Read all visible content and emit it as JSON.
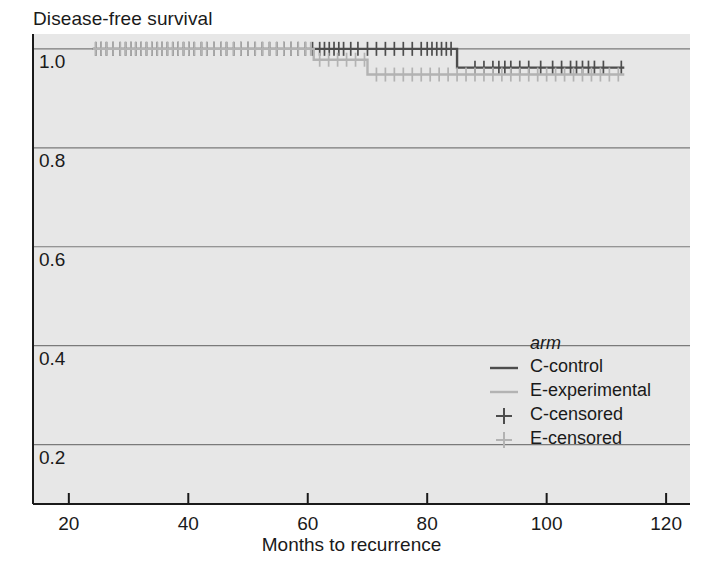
{
  "chart_data": {
    "type": "line",
    "subtype": "kaplan-meier-step",
    "title": "Disease-free survival",
    "xlabel": "Months to recurrence",
    "ylabel": "",
    "xlim": [
      14,
      124
    ],
    "ylim": [
      0.08,
      1.03
    ],
    "xticks": [
      20,
      40,
      60,
      80,
      100,
      120
    ],
    "yticks": [
      1.0,
      0.8,
      0.6,
      0.4,
      0.2
    ],
    "xtick_labels": [
      "20",
      "40",
      "60",
      "80",
      "100",
      "120"
    ],
    "ytick_labels": [
      "1.0",
      "0.8",
      "0.6",
      "0.4",
      "0.2"
    ],
    "grid": "horizontal",
    "legend_position": "inside-right",
    "legend_title": "arm",
    "plot_bgcolor": "#e7e7e7",
    "colors": {
      "control": "#4d4d4d",
      "experimental": "#b3b3b3",
      "grid": "#7a7a7a",
      "axis": "#1a1a1a",
      "background": "#ffffff"
    },
    "series": [
      {
        "name": "C-control",
        "label": "C-control",
        "color": "#4d4d4d",
        "steps": [
          {
            "x": 24.0,
            "y": 1.0
          },
          {
            "x": 85.0,
            "y": 1.0
          },
          {
            "x": 85.0,
            "y": 0.962
          },
          {
            "x": 113.0,
            "y": 0.962
          }
        ],
        "censored_times": [
          24.5,
          25.4,
          26.3,
          27.4,
          28.6,
          29.5,
          30.4,
          31.2,
          32.1,
          33.0,
          33.9,
          34.8,
          35.6,
          36.5,
          37.4,
          38.3,
          39.2,
          40.1,
          41.0,
          42.2,
          43.1,
          44.3,
          45.5,
          46.4,
          47.6,
          48.8,
          50.0,
          51.2,
          52.4,
          53.6,
          54.8,
          56.0,
          57.2,
          58.4,
          59.6,
          60.8,
          62.0,
          62.8,
          63.6,
          64.4,
          65.2,
          66.0,
          67.2,
          68.4,
          70.0,
          71.5,
          73.0,
          74.5,
          76.0,
          77.5,
          79.0,
          80.0,
          80.8,
          81.6,
          82.4,
          83.2,
          84.0,
          88.0,
          89.5,
          91.0,
          92.0,
          93.0,
          94.0,
          95.5,
          97.0,
          99.0,
          101.0,
          102.5,
          104.0,
          105.0,
          106.0,
          107.0,
          108.0,
          109.5,
          112.5
        ],
        "censored_y": [
          1.0,
          0.962
        ],
        "censored_split_time": 85.0
      },
      {
        "name": "E-experimental",
        "label": "E-experimental",
        "color": "#b3b3b3",
        "steps": [
          {
            "x": 24.0,
            "y": 1.0
          },
          {
            "x": 61.0,
            "y": 1.0
          },
          {
            "x": 61.0,
            "y": 0.978
          },
          {
            "x": 70.0,
            "y": 0.978
          },
          {
            "x": 70.0,
            "y": 0.948
          },
          {
            "x": 113.0,
            "y": 0.948
          }
        ],
        "censored_times": [
          24.5,
          25.4,
          26.3,
          27.4,
          28.6,
          29.5,
          30.4,
          31.2,
          32.1,
          33.0,
          33.9,
          34.8,
          35.6,
          36.5,
          37.4,
          38.3,
          39.2,
          40.1,
          41.0,
          42.2,
          43.1,
          44.3,
          45.5,
          46.4,
          47.6,
          48.8,
          50.0,
          51.2,
          52.4,
          53.6,
          54.8,
          56.0,
          57.2,
          58.4,
          59.6,
          60.5,
          62.0,
          63.5,
          65.0,
          66.5,
          68.0,
          69.5,
          71.5,
          73.0,
          74.5,
          76.0,
          77.5,
          79.0,
          80.5,
          82.0,
          83.5,
          85.0,
          86.5,
          88.0,
          89.5,
          91.0,
          92.5,
          94.0,
          95.5,
          97.0,
          98.5,
          100.0,
          101.5,
          103.0,
          104.5,
          106.0,
          107.5,
          109.0,
          110.5,
          112.0
        ],
        "censored_y": [
          1.0,
          0.978,
          0.948
        ]
      }
    ],
    "legend_entries": [
      {
        "label": "C-control",
        "marker": "line",
        "color": "#4d4d4d"
      },
      {
        "label": "E-experimental",
        "marker": "line",
        "color": "#b3b3b3"
      },
      {
        "label": "C-censored",
        "marker": "plus",
        "color": "#4d4d4d"
      },
      {
        "label": "E-censored",
        "marker": "plus",
        "color": "#b3b3b3"
      }
    ]
  }
}
